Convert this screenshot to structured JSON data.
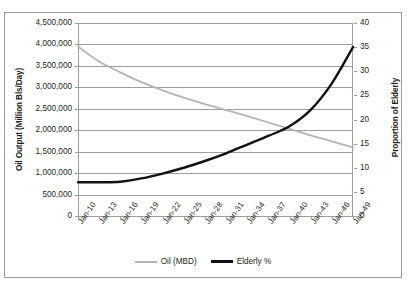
{
  "chart_data": {
    "type": "line",
    "title": "",
    "xlabel": "",
    "ylabel": "Oil Output (Million Bls/Day)",
    "y2label": "Proportion of Elderly",
    "grid": true,
    "legend_position": "bottom-center",
    "categories": [
      "Jan-10",
      "Jan-13",
      "Jan-16",
      "Jan-19",
      "Jan-22",
      "Jan-25",
      "Jan-28",
      "Jan-31",
      "Jan-34",
      "Jan-37",
      "Jan-40",
      "Jan-43",
      "Jan-46",
      "Jan-49"
    ],
    "ylim": [
      0,
      4500000
    ],
    "yticks": [
      "0",
      "500,000",
      "1,000,000",
      "1,500,000",
      "2,000,000",
      "2,500,000",
      "3,000,000",
      "3,500,000",
      "4,000,000",
      "4,500,000"
    ],
    "ytick_values": [
      0,
      500000,
      1000000,
      1500000,
      2000000,
      2500000,
      3000000,
      3500000,
      4000000,
      4500000
    ],
    "y2lim": [
      0,
      40
    ],
    "y2ticks": [
      "0",
      "5",
      "10",
      "15",
      "20",
      "25",
      "30",
      "35",
      "40"
    ],
    "y2tick_values": [
      0,
      5,
      10,
      15,
      20,
      25,
      30,
      35,
      40
    ],
    "series": [
      {
        "name": "Oil (MBD)",
        "axis": "left",
        "color": "#b3b3b3",
        "values": [
          3950000,
          3600000,
          3350000,
          3120000,
          2930000,
          2760000,
          2610000,
          2470000,
          2330000,
          2180000,
          2030000,
          1880000,
          1740000,
          1600000
        ]
      },
      {
        "name": "Elderly %",
        "axis": "right",
        "color": "#111111",
        "values": [
          7.0,
          7.0,
          7.1,
          7.8,
          8.8,
          10.0,
          11.4,
          13.0,
          14.8,
          16.6,
          18.6,
          22.0,
          27.5,
          35.0
        ]
      }
    ]
  },
  "legend": {
    "items": [
      {
        "label": "Oil (MBD)",
        "swatch": "oil"
      },
      {
        "label": "Elderly %",
        "swatch": "elderly"
      }
    ]
  }
}
